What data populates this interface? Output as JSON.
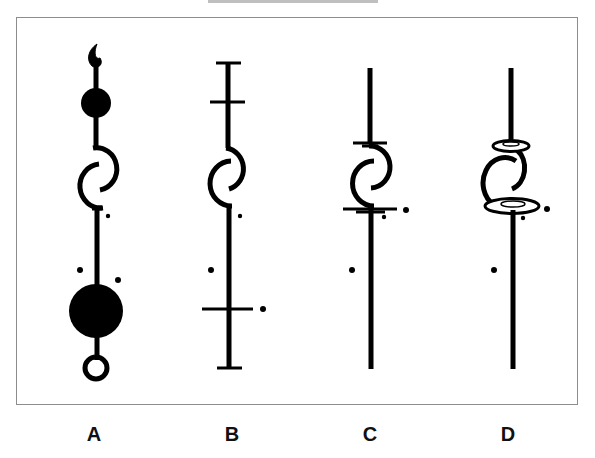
{
  "figure": {
    "title_clipped": "",
    "panels": [
      {
        "label": "A",
        "description": "stem with flame-shaped tip, small filled circle, spiral, three dots, large filled circle, ring at bottom"
      },
      {
        "label": "B",
        "description": "stem with end caps, upper crossbar, spiral, dots, lower crossbar with dot"
      },
      {
        "label": "C",
        "description": "stem with short crossbars above and below spiral, dots"
      },
      {
        "label": "D",
        "description": "stem with flat ellipses (discs) above and below spiral, dots"
      }
    ],
    "colors": {
      "ink": "#000000",
      "frame": "#8d8d8d",
      "background": "#ffffff"
    }
  }
}
